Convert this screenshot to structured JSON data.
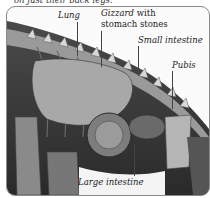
{
  "caption_fragment": "on just their back legs.",
  "labels": {
    "lung": "Lung",
    "gizzard_line1": "Gizzard",
    "gizzard_line2_with": "with",
    "gizzard_line3": "stomach stones",
    "small_intestine": "Small intestine",
    "pubis": "Pubis",
    "large_intestine": "Large intestine"
  },
  "colors": {
    "frame_border": "#8a8a8a",
    "label_text": "#222222"
  }
}
